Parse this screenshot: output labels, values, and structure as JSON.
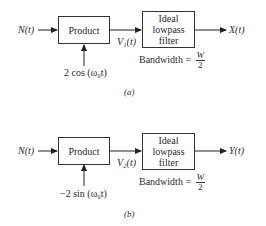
{
  "diagrams": [
    {
      "id": "a",
      "caption": "(a)",
      "input_label": "N(t)",
      "product_label": "Product",
      "carrier_label": "2 cos (ω₀t)",
      "intermediate_label": "V₁(t)",
      "filter_lines": [
        "Ideal",
        "lowpass",
        "filter"
      ],
      "bandwidth_label": "Bandwidth =",
      "bandwidth_num": "W",
      "bandwidth_den": "2",
      "output_label": "X(t)"
    },
    {
      "id": "b",
      "caption": "(b)",
      "input_label": "N(t)",
      "product_label": "Product",
      "carrier_label": "−2 sin (ω₀t)",
      "intermediate_label": "V₂(t)",
      "filter_lines": [
        "Ideal",
        "lowpass",
        "filter"
      ],
      "bandwidth_label": "Bandwidth =",
      "bandwidth_num": "W",
      "bandwidth_den": "2",
      "output_label": "Y(t)"
    }
  ]
}
